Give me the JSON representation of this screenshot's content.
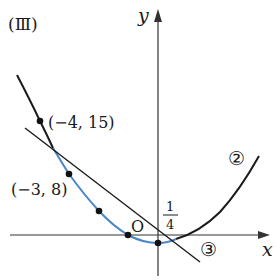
{
  "figure": {
    "label": "(Ⅲ)",
    "axes": {
      "x_label": "x",
      "y_label": "y",
      "origin_label": "O"
    },
    "annotations": {
      "point_a": "(−4, 15)",
      "point_b": "(−3, 8)",
      "y_intercept_num": "1",
      "y_intercept_den": "4",
      "curve_label": "②",
      "line_label": "③"
    },
    "colors": {
      "curve": "#1a1a1a",
      "highlight_curve": "#4a86c8",
      "line": "#1a1a1a",
      "axis": "#333333",
      "background": "#ffffff"
    }
  }
}
